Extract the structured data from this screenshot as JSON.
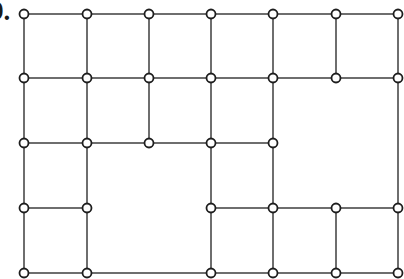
{
  "figure": {
    "label": "9.",
    "type": "planar-graph-grid",
    "colors": {
      "edge": "#6e6e6e",
      "node_stroke": "#1e1e1e",
      "node_fill": "#ffffff",
      "background": "#ffffff"
    },
    "node_radius": 4.5,
    "columns_x": [
      24,
      87,
      149,
      211,
      273,
      336,
      398
    ],
    "rows_y": [
      14,
      78,
      143,
      208,
      273
    ],
    "nodes": [
      {
        "id": "r0c0",
        "c": 0,
        "r": 0
      },
      {
        "id": "r0c1",
        "c": 1,
        "r": 0
      },
      {
        "id": "r0c2",
        "c": 2,
        "r": 0
      },
      {
        "id": "r0c3",
        "c": 3,
        "r": 0
      },
      {
        "id": "r0c4",
        "c": 4,
        "r": 0
      },
      {
        "id": "r0c5",
        "c": 5,
        "r": 0
      },
      {
        "id": "r0c6",
        "c": 6,
        "r": 0
      },
      {
        "id": "r1c0",
        "c": 0,
        "r": 1
      },
      {
        "id": "r1c1",
        "c": 1,
        "r": 1
      },
      {
        "id": "r1c2",
        "c": 2,
        "r": 1
      },
      {
        "id": "r1c3",
        "c": 3,
        "r": 1
      },
      {
        "id": "r1c4",
        "c": 4,
        "r": 1
      },
      {
        "id": "r1c5",
        "c": 5,
        "r": 1
      },
      {
        "id": "r1c6",
        "c": 6,
        "r": 1
      },
      {
        "id": "r2c0",
        "c": 0,
        "r": 2
      },
      {
        "id": "r2c1",
        "c": 1,
        "r": 2
      },
      {
        "id": "r2c2",
        "c": 2,
        "r": 2
      },
      {
        "id": "r2c3",
        "c": 3,
        "r": 2
      },
      {
        "id": "r2c4",
        "c": 4,
        "r": 2
      },
      {
        "id": "r3c0",
        "c": 0,
        "r": 3
      },
      {
        "id": "r3c1",
        "c": 1,
        "r": 3
      },
      {
        "id": "r3c3",
        "c": 3,
        "r": 3
      },
      {
        "id": "r3c4",
        "c": 4,
        "r": 3
      },
      {
        "id": "r3c5",
        "c": 5,
        "r": 3
      },
      {
        "id": "r3c6",
        "c": 6,
        "r": 3
      },
      {
        "id": "r4c0",
        "c": 0,
        "r": 4
      },
      {
        "id": "r4c1",
        "c": 1,
        "r": 4
      },
      {
        "id": "r4c3",
        "c": 3,
        "r": 4
      },
      {
        "id": "r4c4",
        "c": 4,
        "r": 4
      },
      {
        "id": "r4c5",
        "c": 5,
        "r": 4
      },
      {
        "id": "r4c6",
        "c": 6,
        "r": 4
      }
    ],
    "edges": [
      [
        "r0c0",
        "r0c1"
      ],
      [
        "r0c1",
        "r0c2"
      ],
      [
        "r0c2",
        "r0c3"
      ],
      [
        "r0c3",
        "r0c4"
      ],
      [
        "r0c4",
        "r0c5"
      ],
      [
        "r0c5",
        "r0c6"
      ],
      [
        "r1c0",
        "r1c1"
      ],
      [
        "r1c1",
        "r1c2"
      ],
      [
        "r1c2",
        "r1c3"
      ],
      [
        "r1c3",
        "r1c4"
      ],
      [
        "r1c4",
        "r1c5"
      ],
      [
        "r1c5",
        "r1c6"
      ],
      [
        "r2c0",
        "r2c1"
      ],
      [
        "r2c1",
        "r2c2"
      ],
      [
        "r2c2",
        "r2c3"
      ],
      [
        "r2c3",
        "r2c4"
      ],
      [
        "r3c0",
        "r3c1"
      ],
      [
        "r3c3",
        "r3c4"
      ],
      [
        "r3c4",
        "r3c5"
      ],
      [
        "r3c5",
        "r3c6"
      ],
      [
        "r4c0",
        "r4c1"
      ],
      [
        "r4c1",
        "r4c3"
      ],
      [
        "r4c3",
        "r4c4"
      ],
      [
        "r4c4",
        "r4c5"
      ],
      [
        "r4c5",
        "r4c6"
      ],
      [
        "r0c0",
        "r1c0"
      ],
      [
        "r1c0",
        "r2c0"
      ],
      [
        "r2c0",
        "r3c0"
      ],
      [
        "r3c0",
        "r4c0"
      ],
      [
        "r0c1",
        "r1c1"
      ],
      [
        "r1c1",
        "r2c1"
      ],
      [
        "r2c1",
        "r3c1"
      ],
      [
        "r3c1",
        "r4c1"
      ],
      [
        "r0c2",
        "r1c2"
      ],
      [
        "r1c2",
        "r2c2"
      ],
      [
        "r0c3",
        "r1c3"
      ],
      [
        "r1c3",
        "r2c3"
      ],
      [
        "r2c3",
        "r3c3"
      ],
      [
        "r3c3",
        "r4c3"
      ],
      [
        "r0c4",
        "r1c4"
      ],
      [
        "r1c4",
        "r2c4"
      ],
      [
        "r2c4",
        "r3c4"
      ],
      [
        "r3c4",
        "r4c4"
      ],
      [
        "r0c5",
        "r1c5"
      ],
      [
        "r3c5",
        "r4c5"
      ],
      [
        "r0c6",
        "r1c6"
      ],
      [
        "r1c6",
        "r3c6"
      ],
      [
        "r3c6",
        "r4c6"
      ]
    ]
  }
}
